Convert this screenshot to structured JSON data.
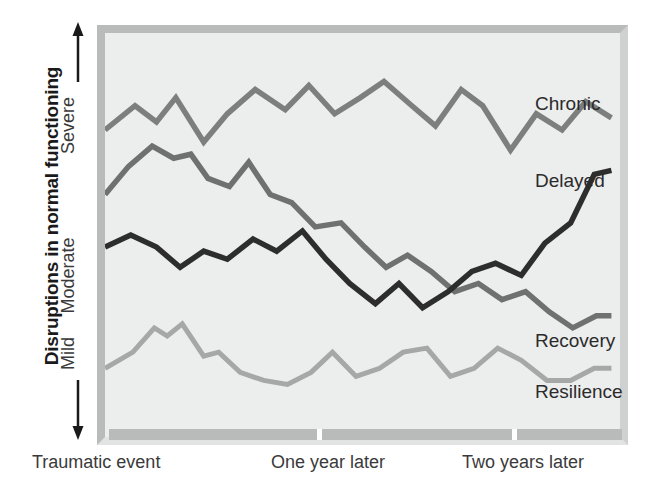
{
  "chart_data": {
    "type": "line",
    "title": "",
    "ylabel": "Disruptions in normal functioning",
    "xlabel": "",
    "grid": false,
    "legend_position": "right-inline",
    "ytick_labels": [
      "Severe",
      "Moderate",
      "Mild"
    ],
    "xtick_labels": [
      "Traumatic event",
      "One year later",
      "Two years later"
    ],
    "y_axis_direction": "Severe at top, Mild at bottom (double-headed arrow)",
    "xlim": [
      0,
      24
    ],
    "ylim": [
      0,
      100
    ],
    "series": [
      {
        "name": "Chronic",
        "color": "#7d7f7f",
        "x": [
          0,
          1.4,
          2.4,
          3.3,
          4.6,
          5.7,
          7.0,
          8.4,
          9.5,
          10.7,
          11.9,
          13.0,
          14.3,
          15.4,
          16.6,
          17.6,
          18.9,
          20.1,
          21.3,
          22.4,
          23.6
        ],
        "values": [
          76,
          82,
          78,
          84,
          73,
          80,
          86,
          81,
          87,
          80,
          84,
          88,
          82,
          77,
          86,
          82,
          71,
          80,
          76,
          83,
          79
        ]
      },
      {
        "name": "Delayed",
        "color": "#2d2d2d",
        "x": [
          0,
          1.2,
          2.4,
          3.5,
          4.6,
          5.7,
          6.9,
          8.0,
          9.2,
          10.3,
          11.4,
          12.6,
          13.7,
          14.8,
          16.0,
          17.1,
          18.2,
          19.4,
          20.5,
          21.7,
          22.8,
          23.6
        ],
        "values": [
          47,
          50,
          47,
          42,
          46,
          44,
          49,
          46,
          51,
          44,
          38,
          33,
          38,
          32,
          36,
          41,
          43,
          40,
          48,
          53,
          65,
          66
        ]
      },
      {
        "name": "Recovery",
        "color": "#6f7171",
        "x": [
          0,
          1.1,
          2.2,
          3.2,
          4.0,
          4.8,
          5.8,
          6.7,
          7.7,
          8.7,
          9.8,
          11.0,
          12.1,
          13.1,
          14.1,
          15.2,
          16.3,
          17.4,
          18.5,
          19.6,
          20.7,
          21.8,
          22.9,
          23.6
        ],
        "values": [
          60,
          67,
          72,
          69,
          70,
          64,
          62,
          68,
          60,
          58,
          52,
          53,
          47,
          42,
          45,
          41,
          36,
          38,
          34,
          36,
          31,
          27,
          30,
          30
        ]
      },
      {
        "name": "Resilience",
        "color": "#a6a8a8",
        "x": [
          0,
          1.3,
          2.3,
          2.9,
          3.6,
          4.6,
          5.3,
          6.3,
          7.4,
          8.5,
          9.6,
          10.6,
          11.7,
          12.8,
          13.9,
          15.0,
          16.1,
          17.2,
          18.3,
          19.4,
          20.6,
          21.7,
          22.8,
          23.6
        ],
        "values": [
          17,
          21,
          27,
          25,
          28,
          20,
          21,
          16,
          14,
          13,
          16,
          21,
          15,
          17,
          21,
          22,
          15,
          17,
          22,
          19,
          14,
          14,
          17,
          17
        ]
      }
    ]
  },
  "y_axis": {
    "title": "Disruptions in normal functioning",
    "ticks": {
      "severe": "Severe",
      "moderate": "Moderate",
      "mild": "Mild"
    },
    "arrow_up": "up-arrow-icon",
    "arrow_down": "down-arrow-icon"
  },
  "x_axis": {
    "labels": [
      "Traumatic event",
      "One year later",
      "Two years later"
    ]
  },
  "series_labels": {
    "chronic": "Chronic",
    "delayed": "Delayed",
    "recovery": "Recovery",
    "resilience": "Resilience"
  },
  "colors": {
    "plot_background": "#eceded",
    "frame": "#b9bbbb",
    "chronic": "#7d7f7f",
    "delayed": "#2d2d2d",
    "recovery": "#6f7171",
    "resilience": "#a6a8a8",
    "text": "#2b2b2b"
  }
}
